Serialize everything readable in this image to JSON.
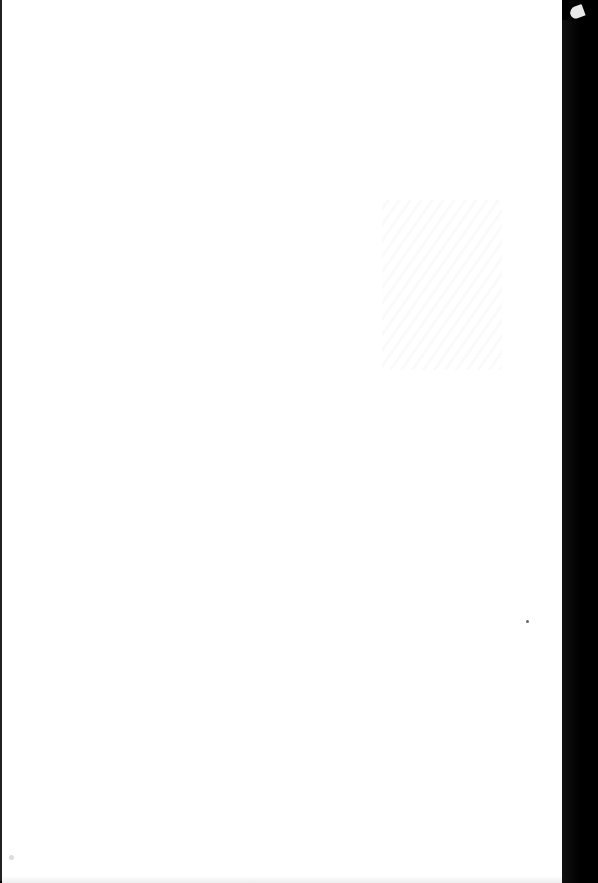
{
  "page": {
    "type": "blank-scanned-page",
    "text": "",
    "colors": {
      "paper": "#ffffff",
      "background": "#000000"
    }
  }
}
